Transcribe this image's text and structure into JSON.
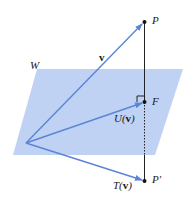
{
  "diagram": {
    "type": "orthogonal-projection",
    "labels": {
      "plane": "W",
      "v": "v",
      "P": "P",
      "F": "F",
      "U": "U(",
      "U_arg": "v",
      "U_close": ")",
      "T": "T(",
      "T_arg": "v",
      "T_close": ")",
      "P_prime": "P′"
    },
    "colors": {
      "plane_fill": "#b9cdf2",
      "vector": "#5a84d6",
      "line": "#222222",
      "point": "#111111"
    },
    "points": {
      "origin": [
        26,
        143
      ],
      "P": [
        144,
        22
      ],
      "F": [
        145,
        102
      ],
      "P_prime": [
        145,
        181
      ]
    },
    "plane_polygon": [
      [
        37,
        69
      ],
      [
        183,
        69
      ],
      [
        155,
        155
      ],
      [
        13,
        155
      ]
    ]
  }
}
